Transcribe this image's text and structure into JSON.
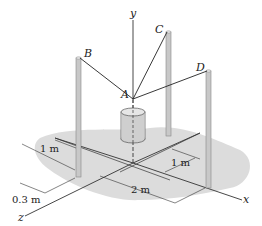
{
  "diagram": {
    "type": "3d-statics-figure",
    "points": {
      "A": "A",
      "B": "B",
      "C": "C",
      "D": "D"
    },
    "axes": {
      "x": "x",
      "y": "y",
      "z": "z"
    },
    "dimensions": {
      "d1": "1 m",
      "d2": "0.3 m",
      "d3": "1 m",
      "d4": "2 m"
    },
    "colors": {
      "ground_shadow": "#d9d9d9",
      "pole": "#c8c8c8",
      "line": "#333333"
    }
  }
}
